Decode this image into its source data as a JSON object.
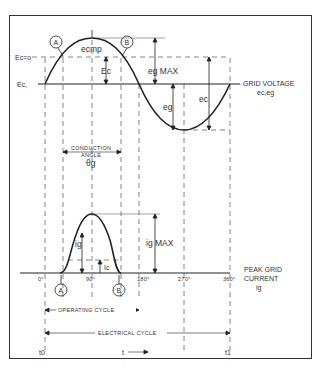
{
  "diagram": {
    "colors": {
      "line": "#222222",
      "dashed": "#666666",
      "background": "#ffffff"
    },
    "voltage_plot": {
      "ec_zero_label": "Ec=o",
      "ec_bias_label": "Ec,",
      "point_a": "A",
      "point_b": "B",
      "ecmp_label": "ecmp",
      "ec_label": "Ec",
      "eg_max_label": "eg MAX",
      "eg_label": "eg",
      "ec_neg_label": "ec",
      "axis_label_line1": "GRID VOLTAGE",
      "axis_label_line2": "ec,eg"
    },
    "conduction": {
      "line1": "CONDUCTION",
      "line2": "ANGLE",
      "symbol": "θg"
    },
    "current_plot": {
      "ig_label": "ig",
      "ig_max_label": "ig MAX",
      "ic_label": "Ic",
      "point_a": "A",
      "point_b": "B",
      "ticks": [
        "0°",
        "90°",
        "180°",
        "270°",
        "360°"
      ],
      "axis_label_line1": "PEAK GRID",
      "axis_label_line2": "CURRENT",
      "axis_label_line3": "ig"
    },
    "cycles": {
      "operating": "OPERATING CYCLE",
      "electrical": "ELECTRICAL CYCLE"
    },
    "time_axis": {
      "t0": "t0",
      "t": "t",
      "t1": "t1"
    }
  }
}
